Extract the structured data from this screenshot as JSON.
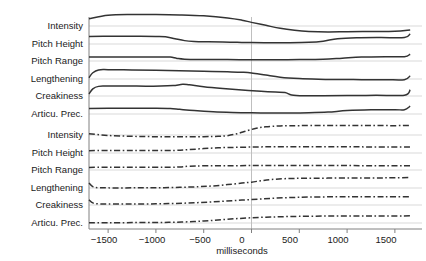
{
  "chart_data": {
    "type": "line",
    "title": "",
    "subtitle": "",
    "xlabel": "milliseconds",
    "ylabel": "",
    "xlim": [
      -1700,
      1700
    ],
    "xticks": [
      -1500,
      -1000,
      -500,
      0,
      500,
      1000,
      1500
    ],
    "xtick_labels": [
      "−1500",
      "−1000",
      "−500",
      "0",
      "500",
      "1000",
      "1500"
    ],
    "grid": true,
    "legend_position": "none",
    "reference_line_x": 0,
    "annotations": [],
    "panels": [
      {
        "name": "upper-panel",
        "linestyle": "solid",
        "rows": [
          {
            "label": "Intensity",
            "baseline_y": 26,
            "x": [
              -1700,
              -1500,
              -1250,
              -1000,
              -750,
              -500,
              -250,
              -100,
              0,
              150,
              300,
              450,
              600,
              800,
              1000,
              1250,
              1500,
              1660
            ],
            "y": [
              0.55,
              0.82,
              0.88,
              0.88,
              0.85,
              0.78,
              0.62,
              0.45,
              0.28,
              0.05,
              -0.18,
              -0.33,
              -0.42,
              -0.46,
              -0.44,
              -0.42,
              -0.4,
              -0.3
            ]
          },
          {
            "label": "Pitch Height",
            "baseline_y": 44,
            "x": [
              -1700,
              -1500,
              -1250,
              -1000,
              -900,
              -800,
              -700,
              -600,
              -450,
              -300,
              -150,
              0,
              200,
              400,
              600,
              750,
              900,
              1100,
              1350,
              1600,
              1660
            ],
            "y": [
              0.58,
              0.6,
              0.6,
              0.58,
              0.55,
              0.4,
              0.26,
              0.2,
              0.17,
              0.15,
              0.13,
              0.11,
              0.1,
              0.1,
              0.13,
              0.22,
              0.4,
              0.48,
              0.5,
              0.5,
              0.78
            ]
          },
          {
            "label": "Pitch Range",
            "baseline_y": 61,
            "x": [
              -1700,
              -1500,
              -1200,
              -950,
              -850,
              -780,
              -700,
              -500,
              -250,
              0,
              250,
              500,
              750,
              950,
              1150,
              1400,
              1600,
              1660
            ],
            "y": [
              0.3,
              0.31,
              0.31,
              0.31,
              0.3,
              0.2,
              0.14,
              0.12,
              0.11,
              0.1,
              0.1,
              0.11,
              0.14,
              0.22,
              0.3,
              0.33,
              0.33,
              0.52
            ]
          },
          {
            "label": "Lengthening",
            "baseline_y": 79,
            "x": [
              -1700,
              -1660,
              -1600,
              -1500,
              -1250,
              -1000,
              -750,
              -500,
              -250,
              -100,
              0,
              150,
              300,
              500,
              700,
              900,
              1150,
              1400,
              1600,
              1660
            ],
            "y": [
              0.1,
              0.48,
              0.7,
              0.72,
              0.7,
              0.67,
              0.63,
              0.59,
              0.55,
              0.52,
              0.47,
              0.3,
              0.14,
              0.03,
              -0.02,
              -0.04,
              -0.05,
              -0.05,
              -0.05,
              0.25
            ]
          },
          {
            "label": "Creakiness",
            "baseline_y": 96,
            "x": [
              -1700,
              -1660,
              -1600,
              -1500,
              -1200,
              -950,
              -820,
              -720,
              -650,
              -500,
              -300,
              -100,
              100,
              250,
              350,
              420,
              550,
              750,
              1000,
              1300,
              1600,
              1660
            ],
            "y": [
              0.15,
              0.55,
              0.74,
              0.76,
              0.76,
              0.76,
              0.8,
              0.9,
              0.86,
              0.72,
              0.58,
              0.46,
              0.36,
              0.3,
              0.27,
              0.08,
              0.02,
              0.02,
              0.03,
              0.05,
              0.06,
              0.48
            ]
          },
          {
            "label": "Articu. Prec.",
            "baseline_y": 114,
            "x": [
              -1700,
              -1500,
              -1200,
              -1000,
              -850,
              -750,
              -600,
              -400,
              -200,
              0,
              200,
              400,
              600,
              800,
              1000,
              1250,
              1500,
              1600,
              1660
            ],
            "y": [
              0.42,
              0.44,
              0.45,
              0.45,
              0.43,
              0.36,
              0.26,
              0.17,
              0.12,
              0.09,
              0.08,
              0.08,
              0.1,
              0.15,
              0.26,
              0.32,
              0.33,
              0.33,
              0.6
            ]
          }
        ]
      },
      {
        "name": "lower-panel",
        "linestyle": "dashdot",
        "rows": [
          {
            "label": "Intensity",
            "baseline_y": 135,
            "x": [
              -1700,
              -1500,
              -1250,
              -1000,
              -750,
              -500,
              -350,
              -250,
              -150,
              -50,
              50,
              150,
              300,
              500,
              750,
              1000,
              1250,
              1500,
              1660
            ],
            "y": [
              0.1,
              -0.04,
              -0.1,
              -0.13,
              -0.14,
              -0.13,
              -0.1,
              -0.05,
              0.1,
              0.32,
              0.52,
              0.63,
              0.7,
              0.72,
              0.73,
              0.73,
              0.73,
              0.72,
              0.74
            ]
          },
          {
            "label": "Pitch Height",
            "baseline_y": 153,
            "x": [
              -1700,
              -1500,
              -1250,
              -1000,
              -800,
              -650,
              -500,
              -350,
              -200,
              -50,
              100,
              250,
              450,
              700,
              950,
              1200,
              1450,
              1660
            ],
            "y": [
              0.18,
              0.19,
              0.19,
              0.19,
              0.2,
              0.26,
              0.34,
              0.4,
              0.43,
              0.45,
              0.47,
              0.48,
              0.48,
              0.48,
              0.48,
              0.47,
              0.46,
              0.46
            ]
          },
          {
            "label": "Pitch Range",
            "baseline_y": 170,
            "x": [
              -1700,
              -1500,
              -1250,
              -1000,
              -850,
              -750,
              -650,
              -500,
              -250,
              0,
              250,
              500,
              750,
              1000,
              1250,
              1500,
              1660
            ],
            "y": [
              0.2,
              0.21,
              0.21,
              0.21,
              0.21,
              0.24,
              0.29,
              0.32,
              0.33,
              0.34,
              0.34,
              0.34,
              0.34,
              0.34,
              0.33,
              0.33,
              0.33
            ]
          },
          {
            "label": "Lengthening",
            "baseline_y": 188,
            "x": [
              -1700,
              -1660,
              -1600,
              -1500,
              -1250,
              -1000,
              -750,
              -550,
              -400,
              -250,
              -100,
              0,
              100,
              200,
              350,
              550,
              800,
              1100,
              1400,
              1660
            ],
            "y": [
              0.38,
              0.1,
              0.02,
              0.01,
              0.01,
              0.02,
              0.05,
              0.1,
              0.16,
              0.26,
              0.38,
              0.45,
              0.56,
              0.65,
              0.72,
              0.75,
              0.76,
              0.77,
              0.78,
              0.8
            ]
          },
          {
            "label": "Creakiness",
            "baseline_y": 205,
            "x": [
              -1700,
              -1660,
              -1600,
              -1500,
              -1250,
              -1000,
              -800,
              -600,
              -400,
              -200,
              0,
              200,
              400,
              600,
              850,
              1100,
              1400,
              1660
            ],
            "y": [
              0.4,
              0.16,
              0.09,
              0.08,
              0.08,
              0.09,
              0.12,
              0.17,
              0.24,
              0.33,
              0.42,
              0.51,
              0.57,
              0.61,
              0.63,
              0.64,
              0.64,
              0.64
            ]
          },
          {
            "label": "Articu. Prec.",
            "baseline_y": 223,
            "x": [
              -1700,
              -1500,
              -1250,
              -1000,
              -800,
              -600,
              -450,
              -300,
              -150,
              0,
              150,
              300,
              500,
              750,
              1000,
              1250,
              1500,
              1660
            ],
            "y": [
              0.02,
              0.02,
              0.03,
              0.04,
              0.06,
              0.11,
              0.18,
              0.26,
              0.34,
              0.4,
              0.45,
              0.48,
              0.51,
              0.53,
              0.54,
              0.54,
              0.54,
              0.55
            ]
          }
        ]
      }
    ],
    "colors": {
      "line": "#333333",
      "gridline": "#d9d9d9",
      "axis": "#808080",
      "reference_line": "#bfbfbf",
      "text": "#1a1a1a"
    }
  }
}
